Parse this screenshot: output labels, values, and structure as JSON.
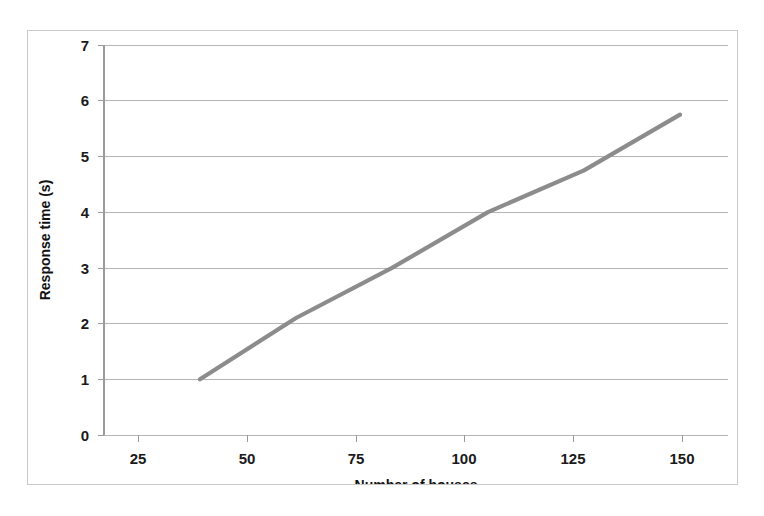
{
  "chart_data": {
    "type": "line",
    "title": "",
    "xlabel": "Number of houses",
    "ylabel": "Response time (s)",
    "xlim": [
      0,
      162.5
    ],
    "ylim": [
      0,
      7
    ],
    "xticks": [
      25,
      50,
      75,
      100,
      125,
      150
    ],
    "xtick_labels": [
      "25",
      "50",
      "75",
      "100",
      "125",
      "150"
    ],
    "yticks": [
      0,
      1,
      2,
      3,
      4,
      5,
      6,
      7
    ],
    "ytick_labels": [
      "0",
      "1",
      "2",
      "3",
      "4",
      "5",
      "6",
      "7"
    ],
    "grid": "horizontal",
    "legend": "none",
    "line_color": "#8c8c8c",
    "series": [
      {
        "name": "Response time",
        "x": [
          25,
          50,
          75,
          100,
          125,
          150
        ],
        "values": [
          1.0,
          2.1,
          3.0,
          4.0,
          4.75,
          5.75
        ]
      }
    ]
  },
  "axes": {
    "y_title": "Response time (s)",
    "x_title": "Number of houses"
  }
}
